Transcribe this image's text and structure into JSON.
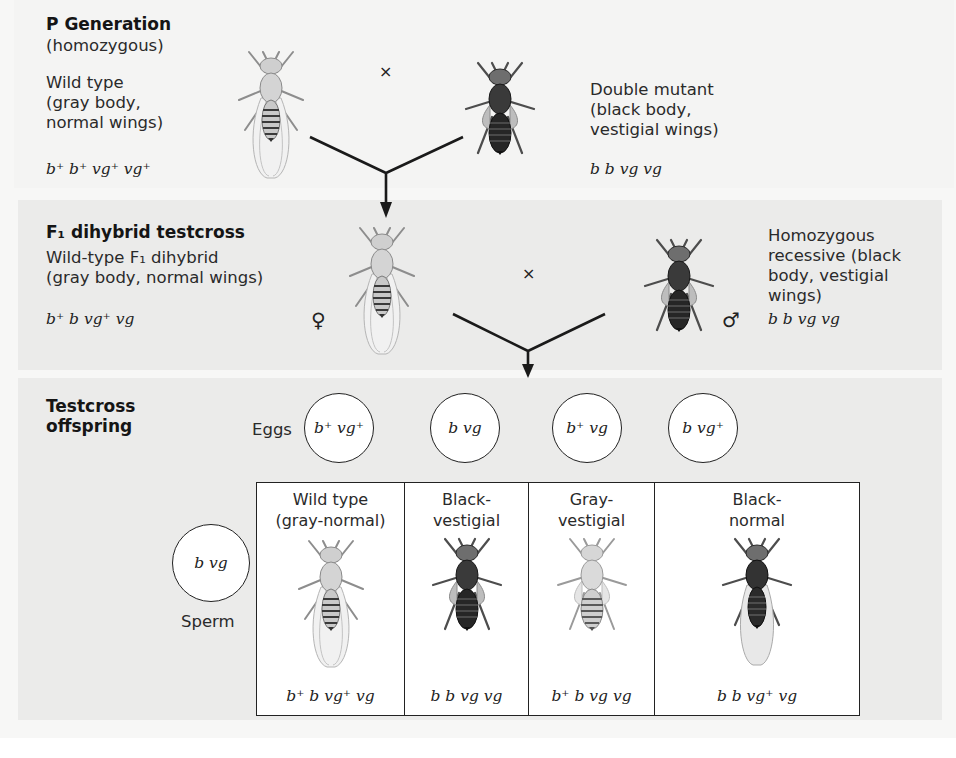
{
  "p_generation": {
    "title": "P Generation",
    "subtitle": "(homozygous)",
    "cross_symbol": "×",
    "wild_type": {
      "line1": "Wild type",
      "line2": "(gray body,",
      "line3": "normal wings)",
      "genotype": "b⁺ b⁺ vg⁺ vg⁺"
    },
    "double_mutant": {
      "line1": "Double mutant",
      "line2": "(black body,",
      "line3": "vestigial wings)",
      "genotype": "b b vg vg"
    }
  },
  "f1_testcross": {
    "title": "F₁ dihybrid testcross",
    "cross_symbol": "×",
    "female": {
      "line1": "Wild-type F₁ dihybrid",
      "line2": "(gray body, normal wings)",
      "genotype": "b⁺ b vg⁺ vg",
      "sex_symbol": "♀"
    },
    "male": {
      "line1": "Homozygous",
      "line2": "recessive (black",
      "line3": "body, vestigial",
      "line4": "wings)",
      "genotype": "b b vg vg",
      "sex_symbol": "♂"
    }
  },
  "testcross_offspring": {
    "title_line1": "Testcross",
    "title_line2": "offspring",
    "eggs_label": "Eggs",
    "eggs": [
      "b⁺ vg⁺",
      "b vg",
      "b⁺ vg",
      "b vg⁺"
    ],
    "sperm_label": "Sperm",
    "sperm": "b vg",
    "offspring": [
      {
        "line1": "Wild type",
        "line2": "(gray-normal)",
        "genotype": "b⁺ b vg⁺ vg",
        "body": "gray",
        "wings": "normal"
      },
      {
        "line1": "Black-",
        "line2": "vestigial",
        "genotype": "b b vg vg",
        "body": "black",
        "wings": "vestigial"
      },
      {
        "line1": "Gray-",
        "line2": "vestigial",
        "genotype": "b⁺ b vg vg",
        "body": "gray",
        "wings": "vestigial"
      },
      {
        "line1": "Black-",
        "line2": "normal",
        "genotype": "b b vg⁺ vg",
        "body": "black",
        "wings": "normal"
      }
    ]
  },
  "colors": {
    "panel_bg": "#ebebea",
    "gray_fly": "#bdbdbd",
    "black_fly": "#2b2b2b",
    "line": "#1a1a1a"
  }
}
